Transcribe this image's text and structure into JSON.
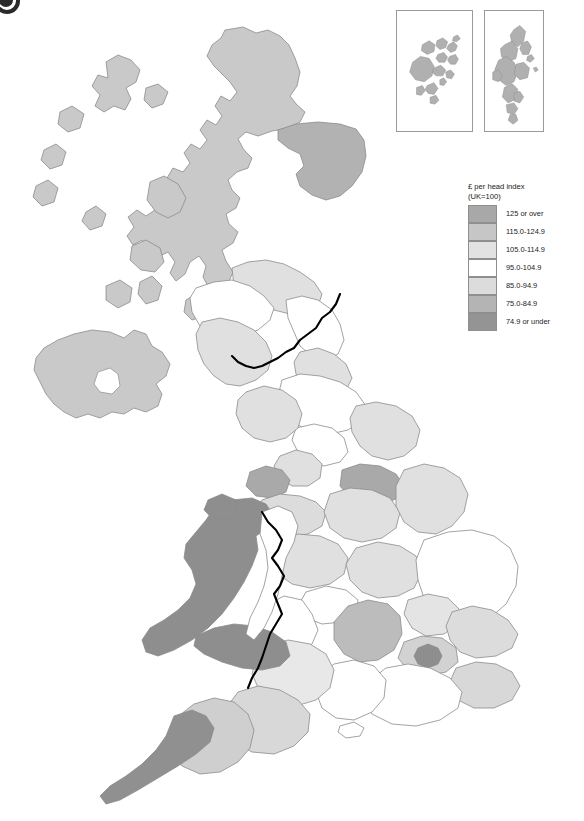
{
  "figure": {
    "label_glyph": "figure-marker"
  },
  "legend": {
    "title": "£ per head index\n(UK=100)",
    "classes": [
      {
        "label": "125 or over",
        "color": "#a8a8a8"
      },
      {
        "label": "115.0-124.9",
        "color": "#c6c6c6"
      },
      {
        "label": "105.0-114.9",
        "color": "#e2e2e2"
      },
      {
        "label": "95.0-104.9",
        "color": "#ffffff"
      },
      {
        "label": "85.0-94.9",
        "color": "#dcdcdc"
      },
      {
        "label": "75.0-84.9",
        "color": "#b4b4b4"
      },
      {
        "label": "74.9 or under",
        "color": "#949494"
      }
    ]
  },
  "insets": [
    {
      "name": "orkney-islands",
      "fill": "#b0b0b0"
    },
    {
      "name": "shetland-islands",
      "fill": "#b0b0b0"
    }
  ],
  "map": {
    "stroke": "#8c8c8c",
    "national_border_stroke": "#000000",
    "sea": "#ffffff"
  },
  "chart_data": {
    "type": "map",
    "title": "£ per head index (UK=100)",
    "variable": "£ per head index",
    "unit": "index, UK=100",
    "classes": [
      "125 or over",
      "115.0-124.9",
      "105.0-114.9",
      "95.0-104.9",
      "85.0-94.9",
      "75.0-84.9",
      "74.9 or under"
    ],
    "regions": [
      {
        "name": "Highlands and Islands",
        "class": "85.0-94.9"
      },
      {
        "name": "North Eastern Scotland",
        "class": "115.0-124.9"
      },
      {
        "name": "Eastern Scotland",
        "class": "105.0-114.9"
      },
      {
        "name": "South Western Scotland",
        "class": "95.0-104.9"
      },
      {
        "name": "Orkney Islands",
        "class": "85.0-94.9"
      },
      {
        "name": "Shetland Islands",
        "class": "85.0-94.9"
      },
      {
        "name": "Northern Ireland",
        "class": "85.0-94.9"
      },
      {
        "name": "Cumbria",
        "class": "95.0-104.9"
      },
      {
        "name": "Northumberland and Tyne and Wear",
        "class": "95.0-104.9"
      },
      {
        "name": "Tees Valley and Durham",
        "class": "85.0-94.9"
      },
      {
        "name": "North Yorkshire",
        "class": "95.0-104.9"
      },
      {
        "name": "West Yorkshire",
        "class": "95.0-104.9"
      },
      {
        "name": "South Yorkshire",
        "class": "75.0-84.9"
      },
      {
        "name": "East Riding and North Lincolnshire",
        "class": "95.0-104.9"
      },
      {
        "name": "Lancashire",
        "class": "95.0-104.9"
      },
      {
        "name": "Greater Manchester",
        "class": "105.0-114.9"
      },
      {
        "name": "Merseyside",
        "class": "75.0-84.9"
      },
      {
        "name": "Cheshire",
        "class": "105.0-114.9"
      },
      {
        "name": "Derbyshire and Nottinghamshire",
        "class": "95.0-104.9"
      },
      {
        "name": "Lincolnshire",
        "class": "95.0-104.9"
      },
      {
        "name": "Shropshire and Staffordshire",
        "class": "95.0-104.9"
      },
      {
        "name": "West Midlands",
        "class": "95.0-104.9"
      },
      {
        "name": "Herefordshire, Worcestershire and Warwickshire",
        "class": "95.0-104.9"
      },
      {
        "name": "Leicestershire, Rutland and Northamptonshire",
        "class": "95.0-104.9"
      },
      {
        "name": "East Anglia",
        "class": "95.0-104.9"
      },
      {
        "name": "Bedfordshire and Hertfordshire",
        "class": "105.0-114.9"
      },
      {
        "name": "Essex",
        "class": "105.0-114.9"
      },
      {
        "name": "Inner London",
        "class": "74.9 or under"
      },
      {
        "name": "Outer London",
        "class": "105.0-114.9"
      },
      {
        "name": "Berkshire, Buckinghamshire and Oxfordshire",
        "class": "115.0-124.9"
      },
      {
        "name": "Surrey, East and West Sussex",
        "class": "95.0-104.9"
      },
      {
        "name": "Hampshire and Isle of Wight",
        "class": "105.0-114.9"
      },
      {
        "name": "Kent",
        "class": "105.0-114.9"
      },
      {
        "name": "Gloucestershire, Wiltshire and Bristol",
        "class": "95.0-104.9"
      },
      {
        "name": "Dorset and Somerset",
        "class": "105.0-114.9"
      },
      {
        "name": "Devon",
        "class": "105.0-114.9"
      },
      {
        "name": "Cornwall and Isles of Scilly",
        "class": "74.9 or under"
      },
      {
        "name": "West Wales and The Valleys",
        "class": "74.9 or under"
      },
      {
        "name": "East Wales",
        "class": "95.0-104.9"
      }
    ]
  }
}
